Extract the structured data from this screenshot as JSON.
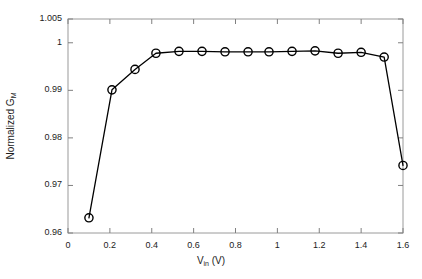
{
  "chart_data": {
    "type": "line",
    "title": "",
    "xlabel": "V_in (V)",
    "xlabel_main": "V",
    "xlabel_sub": "in",
    "xlabel_unit": " (V)",
    "ylabel": "Normalized G_M",
    "ylabel_main": "Normalized G",
    "ylabel_sub": "M",
    "xlim": [
      0,
      1.6
    ],
    "ylim": [
      0.96,
      1.005
    ],
    "xticks": [
      "0",
      "0.2",
      "0.4",
      "0.6",
      "0.8",
      "1",
      "1.2",
      "1.4",
      "1.6"
    ],
    "xtick_values": [
      0,
      0.2,
      0.4,
      0.6,
      0.8,
      1.0,
      1.2,
      1.4,
      1.6
    ],
    "yticks": [
      "0.96",
      "0.97",
      "0.98",
      "0.99",
      "1",
      "1.005"
    ],
    "ytick_values": [
      0.96,
      0.97,
      0.98,
      0.99,
      1.0,
      1.005
    ],
    "grid": false,
    "legend": null,
    "marker": "circle-open",
    "line_color": "#000000",
    "marker_color": "#000000",
    "background_color": "#ffffff",
    "axis_color": "#808080",
    "series": [
      {
        "name": "Normalized G_M",
        "x": [
          0.1,
          0.21,
          0.32,
          0.42,
          0.53,
          0.64,
          0.75,
          0.86,
          0.96,
          1.07,
          1.18,
          1.29,
          1.4,
          1.51,
          1.6
        ],
        "y": [
          0.9632,
          0.9901,
          0.9944,
          0.9978,
          0.9982,
          0.9982,
          0.9981,
          0.9981,
          0.9981,
          0.9982,
          0.9983,
          0.9978,
          0.998,
          0.997,
          0.9742
        ]
      }
    ]
  }
}
